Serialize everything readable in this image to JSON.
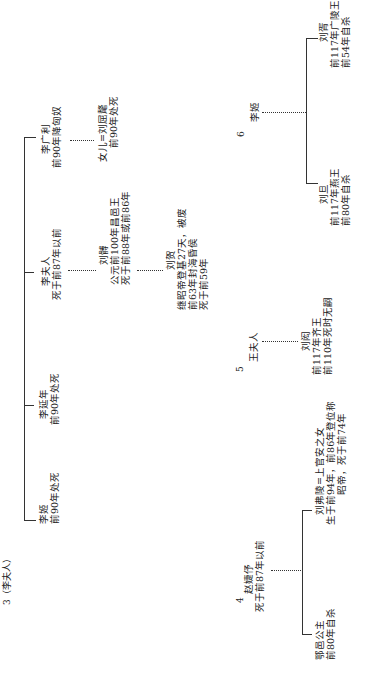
{
  "charts": {
    "chart3": {
      "label": "3（李夫人）",
      "members": [
        {
          "name": "李姬",
          "note": "前90年处死"
        },
        {
          "name": "李延年",
          "note": "前90年处死"
        },
        {
          "name": "李夫人",
          "note": "死于前87年以前"
        },
        {
          "name": "李广利",
          "note": "前90年降匈奴"
        }
      ],
      "spouse_of_li_guangli": {
        "name": "女儿=刘屈氂",
        "note": "前90年处死"
      },
      "son": {
        "name": "刘髆",
        "notes": [
          "公元前100年昌邑王",
          "死于前88年或前86年"
        ]
      },
      "grandson": {
        "name": "刘贺",
        "notes": [
          "继昭帝登基27天，被废",
          "前63年封海昏侯",
          "死于前59年"
        ]
      }
    },
    "chart4": {
      "label": "4",
      "mother": {
        "name": "赵婕伃",
        "note": "死于前87年以前"
      },
      "children": [
        {
          "name": "鄂邑公主",
          "notes": [
            "前80年自杀"
          ]
        },
        {
          "name": "刘弗陵=上官安之女",
          "notes": [
            "生于前94年，前86年登位称",
            "昭帝，死于前74年"
          ]
        }
      ]
    },
    "chart5": {
      "label": "5",
      "mother": {
        "name": "王夫人"
      },
      "child": {
        "name": "刘闳",
        "notes": [
          "前117年齐王",
          "前110年死时无嗣"
        ]
      }
    },
    "chart6": {
      "label": "6",
      "mother": {
        "name": "李姬"
      },
      "children": [
        {
          "name": "刘旦",
          "notes": [
            "前117年燕王",
            "前80年自杀"
          ]
        },
        {
          "name": "刘胥",
          "notes": [
            "前117年广陵王",
            "前54年自杀"
          ]
        }
      ]
    }
  }
}
